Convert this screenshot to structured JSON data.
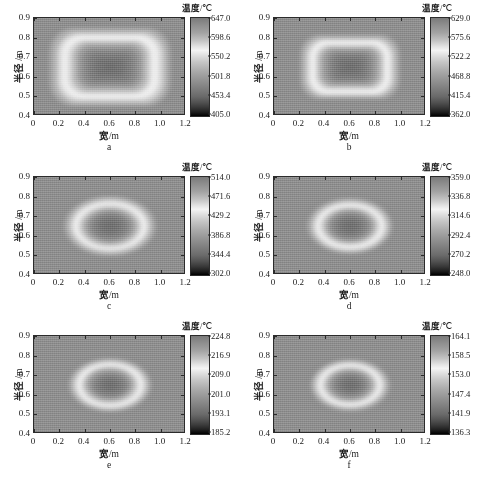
{
  "figure": {
    "panel_count": 6,
    "colorbar_title_cn": "温度",
    "colorbar_title_unit": "/℃",
    "xaxis_title_cn": "宽",
    "xaxis_title_unit": "/m",
    "yaxis_title_cn": "半径",
    "yaxis_title_unit": " /m",
    "x_ticks": [
      "0",
      "0.2",
      "0.4",
      "0.6",
      "0.8",
      "1.0",
      "1.2"
    ],
    "y_ticks": [
      "0.4",
      "0.5",
      "0.6",
      "0.7",
      "0.8",
      "0.9"
    ],
    "xlim": [
      0,
      1.2
    ],
    "ylim": [
      0.4,
      0.9
    ]
  },
  "chart_data": {
    "type": "heatmap",
    "title": "",
    "xlabel": "宽/m",
    "ylabel": "半径 /m",
    "colorbar_label": "温度/℃",
    "colormap": "grayscale",
    "grid": false,
    "legend_position": "right-colorbar",
    "x": [
      0,
      0.2,
      0.4,
      0.6,
      0.8,
      1.0,
      1.2
    ],
    "y": [
      0.4,
      0.5,
      0.6,
      0.7,
      0.8,
      0.9
    ],
    "panels": [
      {
        "id": "a",
        "label": "a",
        "shape": "rounded-rectangle",
        "core_fraction": 0.8,
        "zmin": 405.0,
        "zmax": 647.0,
        "ticks": [
          "647.0",
          "598.6",
          "550.2",
          "501.8",
          "453.4",
          "405.0"
        ],
        "tick_values": [
          647.0,
          598.6,
          550.2,
          501.8,
          453.4,
          405.0
        ],
        "center_temp": 647.0,
        "edge_temp": 405.0
      },
      {
        "id": "b",
        "label": "b",
        "shape": "rounded-rectangle",
        "core_fraction": 0.66,
        "zmin": 362.0,
        "zmax": 629.0,
        "ticks": [
          "629.0",
          "575.6",
          "522.2",
          "468.8",
          "415.4",
          "362.0"
        ],
        "tick_values": [
          629.0,
          575.6,
          522.2,
          468.8,
          415.4,
          362.0
        ],
        "center_temp": 629.0,
        "edge_temp": 362.0
      },
      {
        "id": "c",
        "label": "c",
        "shape": "ellipse",
        "core_fraction": 0.6,
        "zmin": 302.0,
        "zmax": 514.0,
        "ticks": [
          "514.0",
          "471.6",
          "429.2",
          "386.8",
          "344.4",
          "302.0"
        ],
        "tick_values": [
          514.0,
          471.6,
          429.2,
          386.8,
          344.4,
          302.0
        ],
        "center_temp": 514.0,
        "edge_temp": 302.0
      },
      {
        "id": "d",
        "label": "d",
        "shape": "ellipse",
        "core_fraction": 0.56,
        "zmin": 248.0,
        "zmax": 359.0,
        "ticks": [
          "359.0",
          "336.8",
          "314.6",
          "292.4",
          "270.2",
          "248.0"
        ],
        "tick_values": [
          359.0,
          336.8,
          314.6,
          292.4,
          270.2,
          248.0
        ],
        "center_temp": 359.0,
        "edge_temp": 248.0
      },
      {
        "id": "e",
        "label": "e",
        "shape": "ellipse",
        "core_fraction": 0.54,
        "zmin": 185.2,
        "zmax": 224.8,
        "ticks": [
          "224.8",
          "216.9",
          "209.0",
          "201.0",
          "193.1",
          "185.2"
        ],
        "tick_values": [
          224.8,
          216.9,
          209.0,
          201.0,
          193.1,
          185.2
        ],
        "center_temp": 224.8,
        "edge_temp": 185.2
      },
      {
        "id": "f",
        "label": "f",
        "shape": "ellipse",
        "core_fraction": 0.52,
        "zmin": 136.3,
        "zmax": 164.1,
        "ticks": [
          "164.1",
          "158.5",
          "153.0",
          "147.4",
          "141.9",
          "136.3"
        ],
        "tick_values": [
          164.1,
          158.5,
          153.0,
          147.4,
          141.9,
          136.3
        ],
        "center_temp": 164.1,
        "edge_temp": 136.3
      }
    ]
  }
}
